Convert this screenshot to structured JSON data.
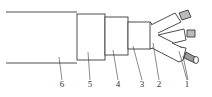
{
  "diagram": {
    "type": "cable-structure",
    "stroke_color": "#3a3a3a",
    "fill_color": "#ffffff",
    "labels": [
      {
        "id": "6",
        "text": "6",
        "x": 58,
        "y": 80
      },
      {
        "id": "5",
        "text": "5",
        "x": 86,
        "y": 80
      },
      {
        "id": "4",
        "text": "4",
        "x": 114,
        "y": 80
      },
      {
        "id": "3",
        "text": "3",
        "x": 138,
        "y": 80
      },
      {
        "id": "2",
        "text": "2",
        "x": 155,
        "y": 80
      },
      {
        "id": "1",
        "text": "1",
        "x": 183,
        "y": 80
      }
    ]
  }
}
